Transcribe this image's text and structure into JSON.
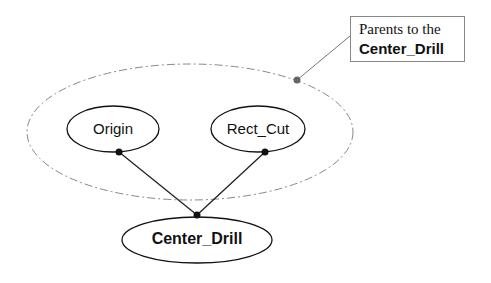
{
  "diagram": {
    "nodes": [
      {
        "id": "origin",
        "label": "Origin"
      },
      {
        "id": "rect_cut",
        "label": "Rect_Cut"
      },
      {
        "id": "center_drill",
        "label": "Center_Drill"
      }
    ],
    "edges": [
      {
        "from": "origin",
        "to": "center_drill"
      },
      {
        "from": "rect_cut",
        "to": "center_drill"
      }
    ],
    "group": {
      "label": "parents-group",
      "members": [
        "origin",
        "rect_cut"
      ]
    },
    "callout": {
      "line1": "Parents to the",
      "line2": "Center_Drill"
    }
  }
}
